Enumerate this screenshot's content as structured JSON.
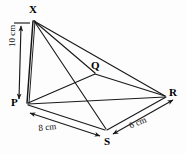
{
  "figure": {
    "type": "geometry-diagram",
    "background_color": "#fdfdfd",
    "line_color": "#1a1a1a",
    "vertices": [
      {
        "id": "X",
        "label": "X",
        "x": 33,
        "y": 20,
        "role": "apex"
      },
      {
        "id": "P",
        "label": "P",
        "x": 25,
        "y": 103,
        "role": "base-corner"
      },
      {
        "id": "Q",
        "label": "Q",
        "x": 95,
        "y": 72,
        "role": "base-corner"
      },
      {
        "id": "R",
        "label": "R",
        "x": 166,
        "y": 96,
        "role": "base-corner"
      },
      {
        "id": "S",
        "label": "S",
        "x": 106,
        "y": 130,
        "role": "base-corner"
      }
    ],
    "edges": [
      {
        "from": "X",
        "to": "P",
        "kind": "vertical-height"
      },
      {
        "from": "X",
        "to": "Q",
        "kind": "lateral"
      },
      {
        "from": "X",
        "to": "R",
        "kind": "lateral"
      },
      {
        "from": "X",
        "to": "S",
        "kind": "lateral"
      },
      {
        "from": "P",
        "to": "Q",
        "kind": "base"
      },
      {
        "from": "Q",
        "to": "R",
        "kind": "base"
      },
      {
        "from": "P",
        "to": "S",
        "kind": "base"
      },
      {
        "from": "S",
        "to": "R",
        "kind": "base"
      },
      {
        "from": "P",
        "to": "R",
        "kind": "base-diagonal"
      }
    ],
    "dimensions": [
      {
        "id": "height",
        "label": "10 cm",
        "value": 10,
        "unit": "cm",
        "between": [
          "X",
          "P"
        ],
        "orientation": "vertical",
        "arrows": "double"
      },
      {
        "id": "base-front-left",
        "label": "8 cm",
        "value": 8,
        "unit": "cm",
        "between": [
          "P",
          "S"
        ],
        "orientation": "diagonal",
        "arrows": "double"
      },
      {
        "id": "base-front-right",
        "label": "6 cm",
        "value": 6,
        "unit": "cm",
        "between": [
          "S",
          "R"
        ],
        "orientation": "diagonal",
        "arrows": "double"
      }
    ]
  }
}
